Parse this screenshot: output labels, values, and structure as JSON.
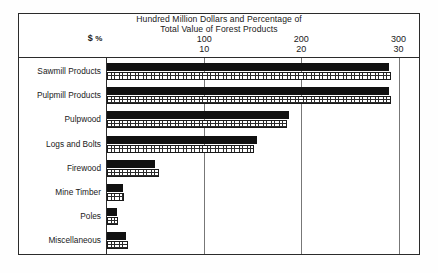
{
  "chart_data": {
    "type": "bar",
    "orientation": "horizontal",
    "title": "Hundred Million Dollars and Percentage of Total Value of Forest Products",
    "title_line1": "Hundred Million Dollars and Percentage of",
    "title_line2": "Total Value of Forest Products",
    "xlabel": "",
    "ylabel": "",
    "grid": true,
    "legend_position": "none",
    "unit_marker_dollars": "$",
    "unit_marker_percent": "%",
    "axis_dollars": {
      "name": "Hundred Million Dollars",
      "ticks": [
        0,
        100,
        200,
        300
      ],
      "tick_labels": [
        "",
        "100",
        "200",
        "300"
      ],
      "range": [
        0,
        320
      ]
    },
    "axis_percent": {
      "name": "Percentage of Total Value of Forest Products",
      "ticks": [
        0,
        10,
        20,
        30
      ],
      "tick_labels": [
        "",
        "10",
        "20",
        "30"
      ],
      "range": [
        0,
        32
      ]
    },
    "categories": [
      "Sawmill Products",
      "Pulpmill Products",
      "Pulpwood",
      "Logs and Bolts",
      "Firewood",
      "Mine Timber",
      "Poles",
      "Miscellaneous"
    ],
    "series": [
      {
        "name": "Hundred Million Dollars",
        "unit": "$",
        "pattern": "solid-black",
        "values": [
          290,
          290,
          187,
          154,
          49,
          16,
          10,
          20
        ]
      },
      {
        "name": "Percentage of Total Value",
        "unit": "%",
        "pattern": "cross-hatch",
        "values": [
          29.2,
          29.2,
          18.5,
          15.1,
          5.4,
          1.7,
          1.1,
          2.2
        ]
      }
    ]
  },
  "ticks": [
    {
      "dollars": "100",
      "percent": "10"
    },
    {
      "dollars": "200",
      "percent": "20"
    },
    {
      "dollars": "300",
      "percent": "30"
    }
  ]
}
